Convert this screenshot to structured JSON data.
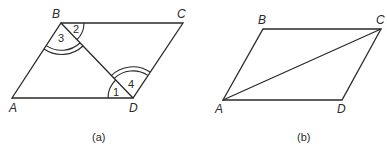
{
  "figure_a": {
    "caption": "(a)",
    "vertices": {
      "A": "A",
      "B": "B",
      "C": "C",
      "D": "D"
    },
    "angle_labels": {
      "angle1": "1",
      "angle2": "2",
      "angle3": "3",
      "angle4": "4"
    },
    "description": "Parallelogram ABCD with diagonal BD; angles 2 and 3 at B, angles 1 and 4 at D"
  },
  "figure_b": {
    "caption": "(b)",
    "vertices": {
      "A": "A",
      "B": "B",
      "C": "C",
      "D": "D"
    },
    "description": "Parallelogram ABCD with diagonal AC"
  },
  "colors": {
    "line": "#2a2a2a",
    "background": "#ffffff"
  }
}
